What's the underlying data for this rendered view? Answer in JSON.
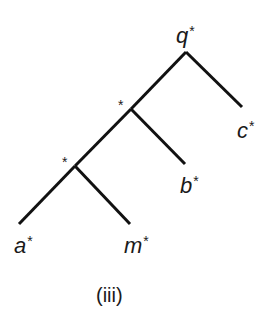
{
  "diagram": {
    "type": "tree",
    "root": {
      "label": "q",
      "marker": "*"
    },
    "internal_nodes": [
      {
        "label": "",
        "marker": "*"
      },
      {
        "label": "",
        "marker": "*"
      }
    ],
    "leaves": [
      {
        "label": "a",
        "marker": "*"
      },
      {
        "label": "m",
        "marker": "*"
      },
      {
        "label": "b",
        "marker": "*"
      },
      {
        "label": "c",
        "marker": "*"
      }
    ],
    "edges": [
      [
        "q*",
        "*node1"
      ],
      [
        "q*",
        "c*"
      ],
      [
        "*node1",
        "*node2"
      ],
      [
        "*node1",
        "b*"
      ],
      [
        "*node2",
        "a*"
      ],
      [
        "*node2",
        "m*"
      ]
    ],
    "caption": "(iii)",
    "line_color": "#111111"
  }
}
